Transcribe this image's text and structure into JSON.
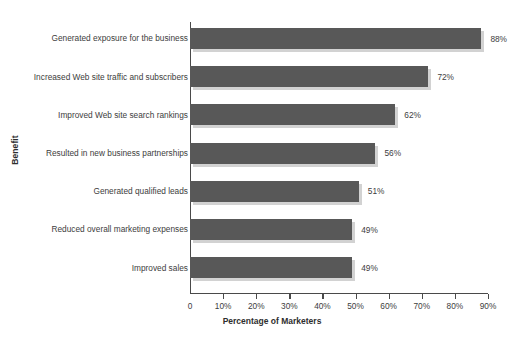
{
  "chart_data": {
    "type": "bar",
    "orientation": "horizontal",
    "title": "",
    "xlabel": "Percentage of Marketers",
    "ylabel": "Benefit",
    "categories": [
      "Generated exposure for the business",
      "Increased Web site traffic and subscribers",
      "Improved Web site search rankings",
      "Resulted in new business partnerships",
      "Generated qualified leads",
      "Reduced overall marketing expenses",
      "Improved sales"
    ],
    "values": [
      88,
      72,
      62,
      56,
      51,
      49,
      49
    ],
    "data_labels": [
      "88%",
      "72%",
      "62%",
      "56%",
      "51%",
      "49%",
      "49%"
    ],
    "xlim": [
      0,
      90
    ],
    "xticks": [
      0,
      10,
      20,
      30,
      40,
      50,
      60,
      70,
      80,
      90
    ],
    "xtick_labels": [
      "0",
      "10%",
      "20%",
      "30%",
      "40%",
      "50%",
      "60%",
      "70%",
      "80%",
      "90%"
    ],
    "grid": false,
    "legend": false,
    "bar_color": "#585858",
    "bar_shadow_color": "#d2d2d2",
    "axis_color": "#4a4a4a",
    "background_color": "#ffffff",
    "text_color": "#3d3d3d"
  }
}
